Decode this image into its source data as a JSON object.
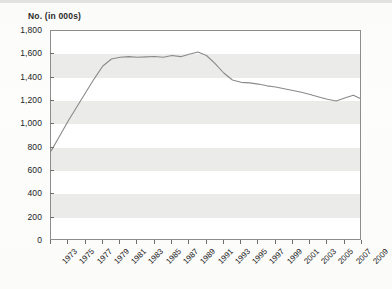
{
  "chart_data": {
    "type": "line",
    "title": "No. (in 000s)",
    "xlabel": "",
    "ylabel": "No. (in 000s)",
    "ylim": [
      0,
      1800
    ],
    "ytick_step": 200,
    "ytick_labels": [
      "1,800",
      "1,600",
      "1,400",
      "1,200",
      "1,000",
      "800",
      "600",
      "400",
      "200",
      "0"
    ],
    "ytick_values": [
      1800,
      1600,
      1400,
      1200,
      1000,
      800,
      600,
      400,
      200,
      0
    ],
    "xlim": [
      1973,
      2009
    ],
    "xtick_labels": [
      "1973",
      "1975",
      "1977",
      "1979",
      "1981",
      "1983",
      "1985",
      "1987",
      "1989",
      "1991",
      "1993",
      "1995",
      "1997",
      "1999",
      "2001",
      "2003",
      "2005",
      "2007",
      "2009"
    ],
    "xtick_values": [
      1973,
      1975,
      1977,
      1979,
      1981,
      1983,
      1985,
      1987,
      1989,
      1991,
      1993,
      1995,
      1997,
      1999,
      2001,
      2003,
      2005,
      2007,
      2009
    ],
    "grid": "horizontal-bands",
    "legend": "none",
    "series": [
      {
        "name": "No. (in 000s)",
        "color": "#8a8a8a",
        "x": [
          1973,
          1974,
          1975,
          1976,
          1977,
          1978,
          1979,
          1980,
          1981,
          1982,
          1983,
          1984,
          1985,
          1986,
          1987,
          1988,
          1989,
          1990,
          1991,
          1992,
          1993,
          1994,
          1995,
          1996,
          1997,
          1998,
          1999,
          2000,
          2001,
          2002,
          2003,
          2004,
          2005,
          2006,
          2007,
          2008,
          2009
        ],
        "values": [
          770,
          900,
          1030,
          1150,
          1270,
          1390,
          1500,
          1560,
          1575,
          1580,
          1575,
          1578,
          1582,
          1575,
          1590,
          1580,
          1600,
          1620,
          1590,
          1520,
          1440,
          1380,
          1360,
          1355,
          1345,
          1330,
          1320,
          1305,
          1290,
          1275,
          1255,
          1235,
          1215,
          1200,
          1225,
          1250,
          1215
        ]
      }
    ]
  }
}
